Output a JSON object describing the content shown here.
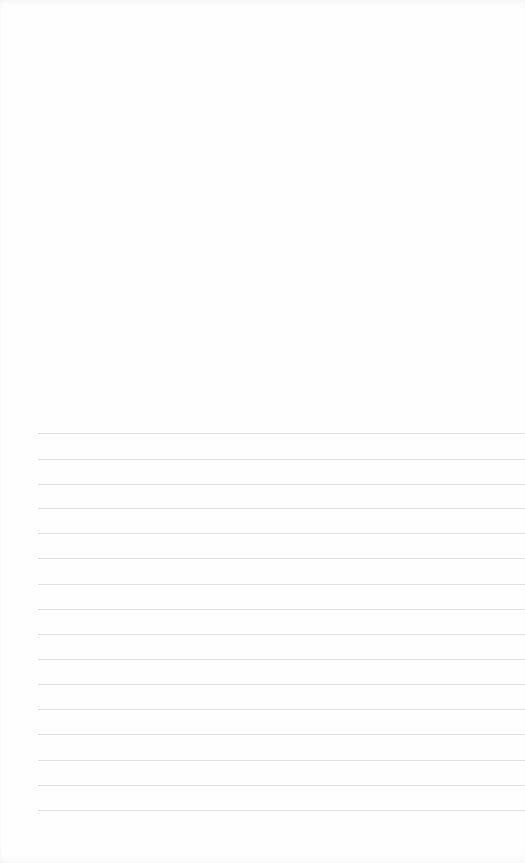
{
  "page": {
    "type": "ruled-sheet",
    "background_color": "#fefefe",
    "line_color": "#e0e0e0",
    "line_left_margin_px": 38,
    "line_count": 16,
    "line_positions_px": [
      433,
      459,
      484,
      508,
      533,
      558,
      584,
      609,
      634,
      659,
      684,
      709,
      734,
      760,
      785,
      810
    ]
  }
}
